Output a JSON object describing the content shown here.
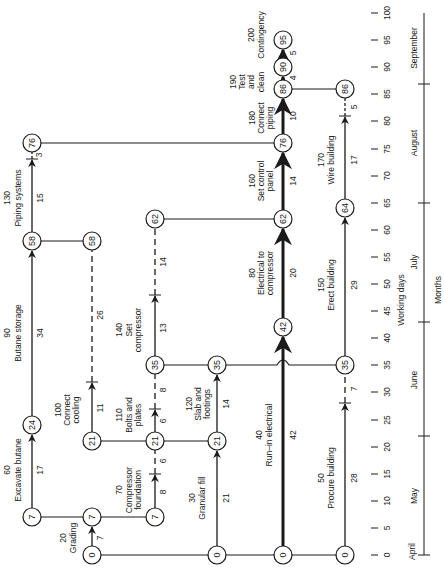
{
  "diagram": {
    "type": "CPM network on time scale (rotated 90°, time increases upward)",
    "time_axis": {
      "label": "Working days",
      "ticks": [
        0,
        5,
        10,
        15,
        20,
        25,
        30,
        35,
        40,
        45,
        50,
        55,
        60,
        65,
        70,
        75,
        80,
        85,
        90,
        95,
        100
      ]
    },
    "months_axis": {
      "label": "Months",
      "months": [
        {
          "name": "April",
          "start": 0,
          "label_day": -2
        },
        {
          "name": "May",
          "start": 0,
          "end": 22
        },
        {
          "name": "June",
          "start": 22,
          "end": 43
        },
        {
          "name": "July",
          "start": 43,
          "end": 65
        },
        {
          "name": "August",
          "start": 65,
          "end": 87
        },
        {
          "name": "September",
          "start": 87,
          "end": 100
        }
      ],
      "dividers": [
        0,
        22,
        43,
        65,
        87
      ]
    },
    "nodes": [
      {
        "id": "n0a",
        "col": 2,
        "day": 0,
        "label": "0"
      },
      {
        "id": "n0b",
        "col": 4,
        "day": 0,
        "label": "0"
      },
      {
        "id": "n0c",
        "col": 5,
        "day": 0,
        "label": "0"
      },
      {
        "id": "n0d",
        "col": 6,
        "day": 0,
        "label": "0"
      },
      {
        "id": "n7a",
        "col": 1,
        "day": 7,
        "label": "7"
      },
      {
        "id": "n7b",
        "col": 2,
        "day": 7,
        "label": "7"
      },
      {
        "id": "n7c",
        "col": 3,
        "day": 7,
        "label": "7"
      },
      {
        "id": "n24",
        "col": 1,
        "day": 24,
        "label": "24"
      },
      {
        "id": "n21a",
        "col": 2.95,
        "day": 21,
        "label": "21"
      },
      {
        "id": "n21b",
        "col": 3,
        "day": 21,
        "label": "21"
      },
      {
        "id": "n21c",
        "col": 4,
        "day": 21,
        "label": "21"
      },
      {
        "id": "n35a",
        "col": 3,
        "day": 35,
        "label": "35"
      },
      {
        "id": "n35b",
        "col": 4,
        "day": 35,
        "label": "35"
      },
      {
        "id": "n35c",
        "col": 6,
        "day": 35,
        "label": "35"
      },
      {
        "id": "n42",
        "col": 5,
        "day": 42,
        "label": "42"
      },
      {
        "id": "n58a",
        "col": 1,
        "day": 58,
        "label": "58"
      },
      {
        "id": "n58b",
        "col": 2,
        "day": 58,
        "label": "58"
      },
      {
        "id": "n62a",
        "col": 3,
        "day": 62,
        "label": "62"
      },
      {
        "id": "n62b",
        "col": 5,
        "day": 62,
        "label": "62"
      },
      {
        "id": "n64",
        "col": 6,
        "day": 64,
        "label": "64"
      },
      {
        "id": "n76a",
        "col": 1,
        "day": 76,
        "label": "76"
      },
      {
        "id": "n76b",
        "col": 5,
        "day": 76,
        "label": "76"
      },
      {
        "id": "n86a",
        "col": 5,
        "day": 86,
        "label": "86"
      },
      {
        "id": "n86b",
        "col": 6,
        "day": 86,
        "label": "86"
      },
      {
        "id": "n90",
        "col": 5,
        "day": 90,
        "label": "90"
      },
      {
        "id": "n95",
        "col": 5,
        "day": 95,
        "label": "95"
      }
    ],
    "activities": [
      {
        "id": "20",
        "name": "Grading",
        "duration": "7"
      },
      {
        "id": "30",
        "name": "Granular fill",
        "duration": "21"
      },
      {
        "id": "40",
        "name": "Run–in electrical",
        "duration": "42"
      },
      {
        "id": "50",
        "name": "Procure building",
        "duration": "28",
        "float": "7"
      },
      {
        "id": "60",
        "name": "Excavate butane",
        "duration": "17"
      },
      {
        "id": "70",
        "name": "Compressor foundation",
        "duration": "8",
        "float": "6"
      },
      {
        "id": "80",
        "name": "Electrical to compressor",
        "duration": "20"
      },
      {
        "id": "90",
        "name": "Butane storage",
        "duration": "34"
      },
      {
        "id": "100",
        "name": "Connect cooling",
        "duration": "11",
        "float": "26"
      },
      {
        "id": "110",
        "name": "Bolts and plates",
        "duration": "6",
        "float": "8"
      },
      {
        "id": "120",
        "name": "Slab and footings",
        "duration": "14"
      },
      {
        "id": "130",
        "name": "Piping systems",
        "duration": "15",
        "float": "3"
      },
      {
        "id": "140",
        "name": "Set compressor",
        "duration": "13",
        "float": "14"
      },
      {
        "id": "150",
        "name": "Erect building",
        "duration": "29"
      },
      {
        "id": "160",
        "name": "Set control panel",
        "duration": "14"
      },
      {
        "id": "170",
        "name": "Wire building",
        "duration": "17",
        "float": "5"
      },
      {
        "id": "180",
        "name": "Connect piping",
        "duration": "10"
      },
      {
        "id": "190",
        "name": "Test and clean",
        "duration": "4"
      },
      {
        "id": "200",
        "name": "Contingency",
        "duration": "5"
      }
    ]
  },
  "labels": {
    "a20_id": "20",
    "a20_l1": "Grading",
    "a20_dur": "7",
    "a30_id": "30",
    "a30_l1": "Granular  fill",
    "a30_dur": "21",
    "a40_id": "40",
    "a40_l1": "Run–in  electrical",
    "a40_dur": "42",
    "a50_id": "50",
    "a50_l1": "Procure  building",
    "a50_dur": "28",
    "a50_float": "7",
    "a60_id": "60",
    "a60_l1": "Excavate  butane",
    "a60_dur": "17",
    "a70_id": "70",
    "a70_l1": "Compressor",
    "a70_l2": "foundation",
    "a70_dur": "8",
    "a70_float": "6",
    "a80_id": "80",
    "a80_l1": "Electrical  to",
    "a80_l2": "compressor",
    "a80_dur": "20",
    "a90_id": "90",
    "a90_l1": "Butane  storage",
    "a90_dur": "34",
    "a100_id": "100",
    "a100_l1": "Connect",
    "a100_l2": "cooling",
    "a100_dur": "11",
    "a100_float": "26",
    "a110_id": "110",
    "a110_l1": "Bolts  and",
    "a110_l2": "plates",
    "a110_dur": "6",
    "a110_float": "8",
    "a120_id": "120",
    "a120_l1": "Slab  and",
    "a120_l2": "footings",
    "a120_dur": "14",
    "a130_id": "130",
    "a130_l1": "Piping  systems",
    "a130_dur": "15",
    "a130_float": "3",
    "a140_id": "140",
    "a140_l1": "Set",
    "a140_l2": "compressor",
    "a140_dur": "13",
    "a140_float": "14",
    "a150_id": "150",
    "a150_l1": "Erect  building",
    "a150_dur": "29",
    "a160_id": "160",
    "a160_l1": "Set  control",
    "a160_l2": "panel",
    "a160_dur": "14",
    "a170_id": "170",
    "a170_l1": "Wire  building",
    "a170_dur": "17",
    "a170_float": "5",
    "a180_id": "180",
    "a180_l1": "Connect",
    "a180_l2": "piping",
    "a180_dur": "10",
    "a190_id": "190",
    "a190_l1": "Test",
    "a190_l2": "and",
    "a190_l3": "clean",
    "a190_dur": "4",
    "a200_id": "200",
    "a200_l1": "Contingency",
    "a200_dur": "5",
    "axis_working_days": "Working days",
    "axis_months": "Months",
    "m_april": "April",
    "m_may": "May",
    "m_june": "June",
    "m_july": "July",
    "m_august": "August",
    "m_september": "September",
    "t0": "0",
    "t5": "5",
    "t10": "10",
    "t15": "15",
    "t20": "20",
    "t25": "25",
    "t30": "30",
    "t35": "35",
    "t40": "40",
    "t45": "45",
    "t50": "50",
    "t55": "55",
    "t60": "60",
    "t65": "65",
    "t70": "70",
    "t75": "75",
    "t80": "80",
    "t85": "85",
    "t90": "90",
    "t95": "95",
    "t100": "100",
    "n0": "0",
    "n7": "7",
    "n21": "21",
    "n24": "24",
    "n35": "35",
    "n42": "42",
    "n58": "58",
    "n62": "62",
    "n64": "64",
    "n76": "76",
    "n86": "86",
    "n90": "90",
    "n95": "95"
  }
}
